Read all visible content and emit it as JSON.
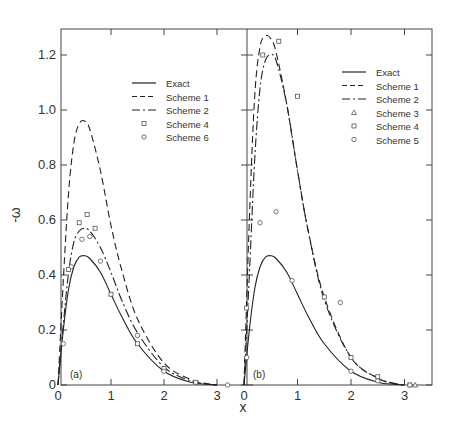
{
  "chart_data": [
    {
      "type": "line",
      "panel_label": "(a)",
      "xlabel": "x",
      "ylabel": "-ω",
      "xlim": [
        0,
        3.2
      ],
      "ylim": [
        0,
        1.3
      ],
      "xticks": [
        "0",
        "1",
        "2",
        "3"
      ],
      "yticks": [
        "0",
        "0.2",
        "0.4",
        "0.6",
        "0.8",
        "1.0",
        "1.2"
      ],
      "grid": false,
      "legend_position": "upper right",
      "legend": [
        {
          "label": "Exact",
          "style": "solid"
        },
        {
          "label": "Scheme 1",
          "style": "dashed"
        },
        {
          "label": "Scheme 2",
          "style": "dash-dot"
        },
        {
          "label": "Scheme 4",
          "style": "square-marker"
        },
        {
          "label": "Scheme 6",
          "style": "circle-marker"
        }
      ],
      "series": [
        {
          "name": "Exact",
          "style": "solid",
          "x": [
            0,
            0.1,
            0.2,
            0.3,
            0.4,
            0.5,
            0.6,
            0.8,
            1.0,
            1.2,
            1.5,
            2.0,
            2.5,
            2.8,
            3.0
          ],
          "y": [
            0,
            0.2,
            0.35,
            0.43,
            0.465,
            0.47,
            0.46,
            0.41,
            0.33,
            0.25,
            0.15,
            0.05,
            0.01,
            0.003,
            0.0
          ]
        },
        {
          "name": "Scheme 1",
          "style": "dashed",
          "x": [
            0,
            0.1,
            0.2,
            0.3,
            0.4,
            0.5,
            0.6,
            0.8,
            1.0,
            1.2,
            1.5,
            2.0,
            2.5,
            2.8,
            3.0
          ],
          "y": [
            0,
            0.38,
            0.7,
            0.88,
            0.95,
            0.96,
            0.93,
            0.78,
            0.58,
            0.42,
            0.24,
            0.08,
            0.02,
            0.005,
            0.0
          ]
        },
        {
          "name": "Scheme 2",
          "style": "dash-dot",
          "x": [
            0,
            0.1,
            0.2,
            0.3,
            0.4,
            0.5,
            0.6,
            0.8,
            1.0,
            1.2,
            1.5,
            2.0,
            2.5,
            2.8,
            3.0
          ],
          "y": [
            0,
            0.22,
            0.41,
            0.52,
            0.56,
            0.57,
            0.56,
            0.5,
            0.41,
            0.31,
            0.19,
            0.065,
            0.015,
            0.004,
            0.0
          ]
        },
        {
          "name": "Scheme 4",
          "style": "square-marker",
          "x": [
            0.2,
            0.4,
            0.55,
            0.7,
            1.0,
            1.5,
            2.0,
            2.6
          ],
          "y": [
            0.42,
            0.59,
            0.62,
            0.57,
            0.33,
            0.15,
            0.06,
            0.01
          ]
        },
        {
          "name": "Scheme 6",
          "style": "circle-marker",
          "x": [
            0.1,
            0.25,
            0.45,
            0.6,
            0.8,
            1.5,
            2.0,
            3.2
          ],
          "y": [
            0.15,
            0.43,
            0.53,
            0.54,
            0.45,
            0.18,
            0.05,
            0.0
          ]
        }
      ]
    },
    {
      "type": "line",
      "panel_label": "(b)",
      "xlabel": "x",
      "ylabel": "-ω",
      "xlim": [
        0,
        3.5
      ],
      "ylim": [
        0,
        1.3
      ],
      "xticks": [
        "0",
        "1",
        "2",
        "3"
      ],
      "grid": false,
      "legend_position": "upper right",
      "legend": [
        {
          "label": "Exact",
          "style": "solid"
        },
        {
          "label": "Scheme 1",
          "style": "dashed"
        },
        {
          "label": "Scheme 2",
          "style": "dash-dot"
        },
        {
          "label": "Scheme 3",
          "style": "triangle-marker"
        },
        {
          "label": "Scheme 4",
          "style": "square-marker"
        },
        {
          "label": "Scheme 5",
          "style": "circle-marker"
        }
      ],
      "series": [
        {
          "name": "Exact",
          "style": "solid",
          "x": [
            0,
            0.1,
            0.2,
            0.3,
            0.4,
            0.5,
            0.6,
            0.8,
            1.0,
            1.2,
            1.5,
            2.0,
            2.5,
            2.8,
            3.0
          ],
          "y": [
            0,
            0.2,
            0.35,
            0.43,
            0.465,
            0.47,
            0.46,
            0.41,
            0.33,
            0.25,
            0.15,
            0.05,
            0.01,
            0.003,
            0.0
          ]
        },
        {
          "name": "Scheme 1",
          "style": "dashed",
          "x": [
            0,
            0.1,
            0.2,
            0.3,
            0.4,
            0.5,
            0.6,
            0.8,
            1.0,
            1.2,
            1.5,
            2.0,
            2.5,
            2.8,
            3.0
          ],
          "y": [
            0,
            0.6,
            1.05,
            1.23,
            1.27,
            1.26,
            1.21,
            1.02,
            0.78,
            0.56,
            0.32,
            0.1,
            0.025,
            0.006,
            0.0
          ]
        },
        {
          "name": "Scheme 2",
          "style": "dash-dot",
          "x": [
            0,
            0.1,
            0.2,
            0.3,
            0.4,
            0.5,
            0.6,
            0.8,
            1.0,
            1.2,
            1.5,
            2.0,
            2.5,
            2.8,
            3.0
          ],
          "y": [
            0,
            0.4,
            0.82,
            1.08,
            1.18,
            1.2,
            1.18,
            1.02,
            0.78,
            0.56,
            0.31,
            0.1,
            0.025,
            0.006,
            0.0
          ]
        },
        {
          "name": "Scheme 3",
          "style": "triangle-marker",
          "x": [
            3.2
          ],
          "y": [
            0.0
          ]
        },
        {
          "name": "Scheme 4",
          "style": "square-marker",
          "x": [
            0.05,
            0.35,
            0.65,
            1.0,
            1.5,
            2.0,
            2.5,
            3.1
          ],
          "y": [
            0.28,
            1.2,
            1.25,
            1.05,
            0.32,
            0.1,
            0.03,
            0.0
          ]
        },
        {
          "name": "Scheme 5",
          "style": "circle-marker",
          "x": [
            0.05,
            0.3,
            0.6,
            0.9,
            1.8,
            2.0,
            2.5,
            3.1
          ],
          "y": [
            0.1,
            0.59,
            0.63,
            0.38,
            0.3,
            0.05,
            0.015,
            0.0
          ]
        }
      ]
    }
  ],
  "figure": {
    "ylabel": "-ω",
    "xlabel": "x",
    "panel_a_label": "(a)",
    "panel_b_label": "(b)",
    "ytick_labels": [
      "0",
      "0.2",
      "0.4",
      "0.6",
      "0.8",
      "1.0",
      "1.2"
    ],
    "xtick_labels_a": [
      "0",
      "1",
      "2",
      "3"
    ],
    "xtick_labels_b": [
      "0",
      "1",
      "2",
      "3"
    ],
    "legend_a": [
      "Exact",
      "Scheme 1",
      "Scheme 2",
      "Scheme 4",
      "Scheme 6"
    ],
    "legend_b": [
      "Exact",
      "Scheme 1",
      "Scheme 2",
      "Scheme 3",
      "Scheme 4",
      "Scheme 5"
    ]
  }
}
